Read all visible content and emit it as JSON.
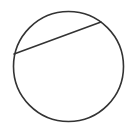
{
  "diagram": {
    "type": "geometry",
    "stroke_color": "#333333",
    "background": "#ffffff",
    "circle": {
      "cx": 68.5,
      "cy": 66.5,
      "r": 55
    },
    "chord": {
      "x1": 14,
      "y1": 54,
      "x2": 101,
      "y2": 22
    }
  }
}
